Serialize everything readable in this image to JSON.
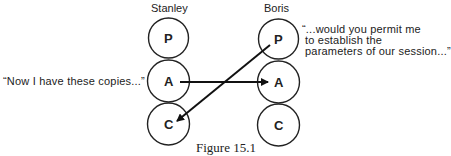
{
  "figure": {
    "caption": "Figure 15.1",
    "participants": [
      {
        "name": "Stanley",
        "states": [
          "P",
          "A",
          "C"
        ]
      },
      {
        "name": "Boris",
        "states": [
          "P",
          "A",
          "C"
        ]
      }
    ],
    "quotes": {
      "left": "“Now I have these copies...”",
      "right_lines": [
        "“...would you permit me",
        "to establish the",
        "parameters of our session...”"
      ]
    },
    "transactions": [
      {
        "from": "Stanley.A",
        "to": "Boris.A"
      },
      {
        "from": "Boris.P",
        "to": "Stanley.C"
      }
    ]
  }
}
